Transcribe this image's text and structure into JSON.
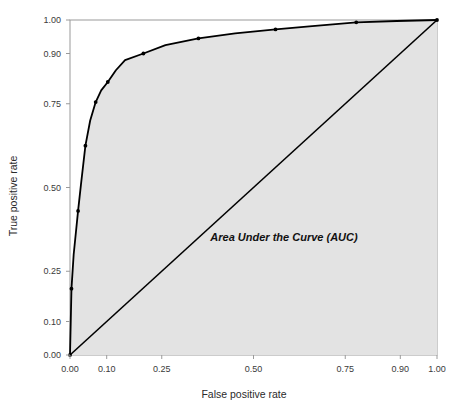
{
  "chart_data": {
    "type": "line",
    "title": "",
    "subtitle": "",
    "xlabel": "False positive rate",
    "ylabel": "True positive rate",
    "xlim": [
      0.0,
      1.0
    ],
    "ylim": [
      0.0,
      1.0
    ],
    "grid": false,
    "legend": "none",
    "x_ticks": [
      "0.00",
      "0.10",
      "0.25",
      "0.50",
      "0.75",
      "0.90",
      "1.00"
    ],
    "x_tick_values": [
      0.0,
      0.1,
      0.25,
      0.5,
      0.75,
      0.9,
      1.0
    ],
    "y_ticks": [
      "0.00",
      "0.10",
      "0.25",
      "0.50",
      "0.75",
      "0.90",
      "1.00"
    ],
    "y_tick_values": [
      0.0,
      0.1,
      0.25,
      0.5,
      0.75,
      0.9,
      1.0
    ],
    "series": [
      {
        "name": "ROC curve",
        "color": "#000000",
        "x": [
          0.0,
          0.004,
          0.01,
          0.022,
          0.03,
          0.042,
          0.055,
          0.07,
          0.085,
          0.103,
          0.125,
          0.15,
          0.2,
          0.26,
          0.35,
          0.45,
          0.56,
          0.66,
          0.78,
          0.89,
          1.0
        ],
        "y": [
          0.0,
          0.198,
          0.3,
          0.43,
          0.51,
          0.625,
          0.7,
          0.755,
          0.79,
          0.815,
          0.85,
          0.88,
          0.9,
          0.925,
          0.945,
          0.96,
          0.972,
          0.982,
          0.993,
          0.997,
          1.0
        ],
        "marker_x": [
          0.0,
          0.004,
          0.022,
          0.042,
          0.07,
          0.103,
          0.2,
          0.35,
          0.56,
          0.78,
          1.0
        ],
        "marker_y": [
          0.0,
          0.198,
          0.43,
          0.625,
          0.755,
          0.815,
          0.9,
          0.945,
          0.972,
          0.993,
          1.0
        ]
      },
      {
        "name": "Chance diagonal",
        "color": "#000000",
        "x": [
          0.0,
          1.0
        ],
        "y": [
          0.0,
          1.0
        ]
      }
    ],
    "fill": {
      "label": "Area Under the Curve (AUC)",
      "color": "#e3e3e3",
      "region": "under ROC curve"
    },
    "annotations": [
      {
        "text": "Area Under the Curve (AUC)",
        "x": 0.48,
        "y": 0.37,
        "style": "bold-italic"
      }
    ]
  },
  "axes": {
    "x_title": "False positive rate",
    "y_title": "True positive rate"
  },
  "colors": {
    "background": "#ffffff",
    "plot_fill": "#e3e3e3",
    "line": "#000000",
    "frame": "#9a9a9a",
    "tick_text": "#3a3a3a"
  }
}
